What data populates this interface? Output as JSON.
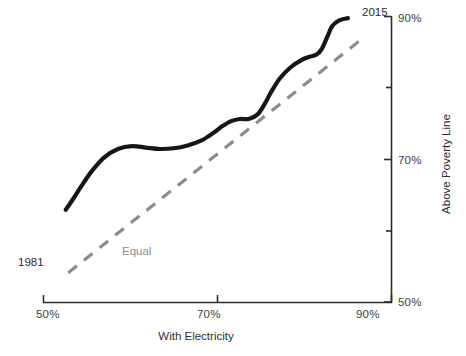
{
  "chart_data": {
    "type": "line",
    "title": "",
    "xlabel": "With Electricity",
    "ylabel": "Above Poverty Line",
    "xlim": [
      50,
      90
    ],
    "ylim": [
      50,
      90
    ],
    "grid": false,
    "legend_position": "inline-annotation",
    "xticks": [
      "50%",
      "70%",
      "90%"
    ],
    "xtick_values": [
      50,
      70,
      90
    ],
    "yticks": [
      "50%",
      "70%",
      "90%"
    ],
    "ytick_values": [
      50,
      70,
      90
    ],
    "minor_ytick_values": [
      60,
      80
    ],
    "annotations": [
      {
        "name": "start-year",
        "text": "1981",
        "x": 52.5,
        "y": 62.5
      },
      {
        "name": "end-year",
        "text": "2015",
        "x": 83.5,
        "y": 90.0
      },
      {
        "name": "reference-line-label",
        "text": "Equal",
        "x": 65.0,
        "y": 62.0
      }
    ],
    "series": [
      {
        "name": "trajectory",
        "label": "",
        "color": "#161616",
        "style": "solid",
        "width": 4.2,
        "points": [
          {
            "x": 52.6,
            "y": 62.9
          },
          {
            "x": 53.4,
            "y": 64.3
          },
          {
            "x": 54.4,
            "y": 66.2
          },
          {
            "x": 55.6,
            "y": 68.3
          },
          {
            "x": 57.0,
            "y": 70.2
          },
          {
            "x": 58.6,
            "y": 71.4
          },
          {
            "x": 60.2,
            "y": 71.8
          },
          {
            "x": 61.8,
            "y": 71.6
          },
          {
            "x": 63.4,
            "y": 71.4
          },
          {
            "x": 65.0,
            "y": 71.5
          },
          {
            "x": 66.6,
            "y": 71.9
          },
          {
            "x": 68.2,
            "y": 72.6
          },
          {
            "x": 69.5,
            "y": 73.6
          },
          {
            "x": 70.6,
            "y": 74.6
          },
          {
            "x": 71.6,
            "y": 75.3
          },
          {
            "x": 72.6,
            "y": 75.6
          },
          {
            "x": 73.6,
            "y": 75.6
          },
          {
            "x": 74.6,
            "y": 76.2
          },
          {
            "x": 75.4,
            "y": 77.6
          },
          {
            "x": 76.2,
            "y": 79.4
          },
          {
            "x": 77.2,
            "y": 81.3
          },
          {
            "x": 78.4,
            "y": 82.8
          },
          {
            "x": 79.6,
            "y": 83.8
          },
          {
            "x": 80.6,
            "y": 84.3
          },
          {
            "x": 81.4,
            "y": 84.6
          },
          {
            "x": 82.0,
            "y": 85.4
          },
          {
            "x": 82.6,
            "y": 87.0
          },
          {
            "x": 83.2,
            "y": 88.6
          },
          {
            "x": 84.0,
            "y": 89.4
          },
          {
            "x": 85.0,
            "y": 89.7
          }
        ]
      },
      {
        "name": "equal-reference",
        "label": "Equal",
        "color": "#8c8c8c",
        "style": "dashed",
        "width": 3.2,
        "points": [
          {
            "x": 52.9,
            "y": 54.1
          },
          {
            "x": 86.3,
            "y": 86.5
          }
        ]
      }
    ]
  },
  "axes": {
    "x_title": "With Electricity",
    "y_title": "Above Poverty Line",
    "x_ticks": [
      {
        "label": "50%"
      },
      {
        "label": "70%"
      },
      {
        "label": "90%"
      }
    ],
    "y_ticks": [
      {
        "label": "50%"
      },
      {
        "label": "70%"
      },
      {
        "label": "90%"
      }
    ]
  },
  "annotations": {
    "start_year": "1981",
    "end_year": "2015",
    "equal_line": "Equal"
  },
  "caption": {
    "text": ""
  },
  "colors": {
    "curve": "#161616",
    "reference": "#8c8c8c",
    "axis": "#2b2b2b",
    "text": "#3a3a3a"
  }
}
